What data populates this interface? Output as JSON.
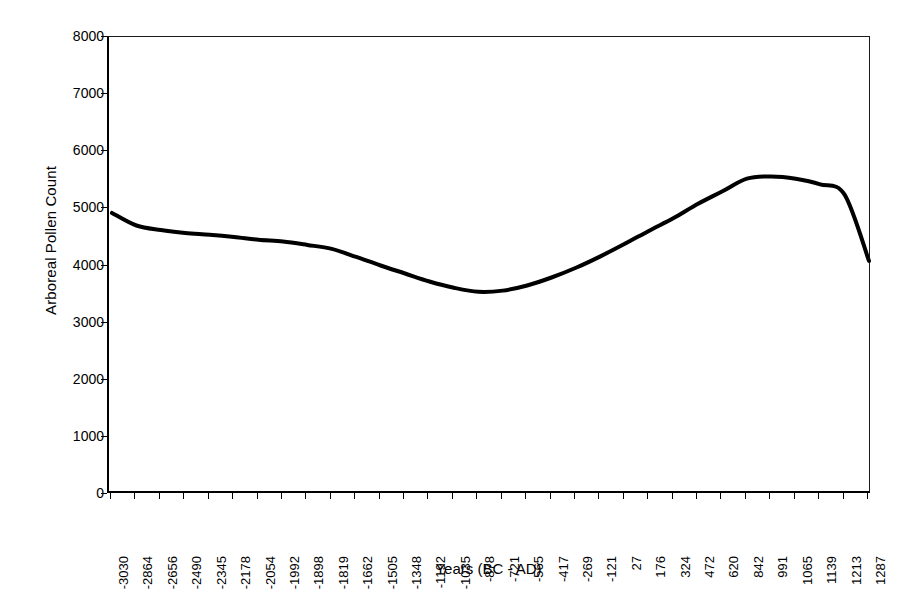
{
  "chart_data": {
    "type": "line",
    "title": "",
    "xlabel": "Years (BC - AD)",
    "ylabel": "Arboreal Pollen Count",
    "xlim": [
      -3030,
      1287
    ],
    "ylim": [
      0,
      8000
    ],
    "grid": false,
    "legend": "none",
    "y_ticks": [
      0,
      1000,
      2000,
      3000,
      4000,
      5000,
      6000,
      7000,
      8000
    ],
    "y_tick_labels": [
      "0",
      "1000",
      "2000",
      "3000",
      "4000",
      "5000",
      "6000",
      "7000",
      "8000"
    ],
    "categories": [
      "-3030",
      "-2864",
      "-2656",
      "-2490",
      "-2345",
      "-2178",
      "-2054",
      "-1992",
      "-1898",
      "-1819",
      "-1662",
      "-1505",
      "-1348",
      "-1192",
      "-1035",
      "-878",
      "-721",
      "-565",
      "-417",
      "-269",
      "-121",
      "27",
      "176",
      "324",
      "472",
      "620",
      "842",
      "991",
      "1065",
      "1139",
      "1213",
      "1287"
    ],
    "series": [
      {
        "name": "Arboreal Pollen Count",
        "color": "#000000",
        "line_width": 4,
        "values": [
          4920,
          4700,
          4620,
          4570,
          4540,
          4500,
          4450,
          4420,
          4360,
          4290,
          4150,
          4000,
          3860,
          3720,
          3610,
          3540,
          3560,
          3650,
          3790,
          3960,
          4160,
          4380,
          4610,
          4830,
          5080,
          5300,
          5520,
          5560,
          5520,
          5420,
          5240,
          4080
        ]
      }
    ]
  }
}
